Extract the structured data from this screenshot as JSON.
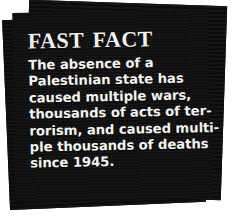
{
  "callout": {
    "headline": "Fast Fact",
    "body_lines": [
      "The absence of a",
      "Palestinian state has",
      "caused multiple wars,",
      "thousands of acts of ter-",
      "rorism, and caused multi-",
      "ple thousands of deaths",
      "since 1945."
    ],
    "body_text": "The absence of a Palestinian state has caused multiple wars, thousands of acts of terrorism, and caused multiple thousands of deaths since 1945.",
    "colors": {
      "panel_background": "#0f0f0f",
      "panel_back": "#101010",
      "panel_mid": "#111111",
      "text": "#f6f5f2",
      "headline_text": "#f4f2ee",
      "page_background": "#ffffff"
    }
  }
}
